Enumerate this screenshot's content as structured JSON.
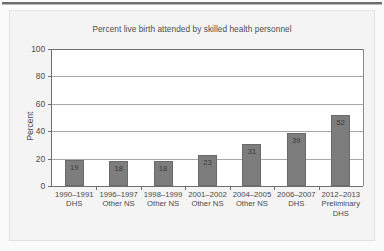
{
  "figure": {
    "background_color": "#fbfbfb",
    "panel_color": "#f4f4f4",
    "top_rule_color": "#6e6e6e"
  },
  "chart_data": {
    "type": "bar",
    "title": "Percent live birth attended by skilled health personnel",
    "xlabel": "",
    "ylabel": "Percent",
    "ylim": [
      0,
      100
    ],
    "yticks": [
      0,
      20,
      40,
      60,
      80,
      100
    ],
    "grid": true,
    "legend": "none",
    "bar_color": "#7d7d7d",
    "categories": [
      "1990–1991 DHS",
      "1996–1997 Other NS",
      "1998–1999 Other NS",
      "2001–2002 Other NS",
      "2004–2005 Other NS",
      "2006–2007 DHS",
      "2012–2013 Preliminary DHS"
    ],
    "category_lines": [
      [
        "1990–1991",
        "DHS"
      ],
      [
        "1996–1997",
        "Other NS"
      ],
      [
        "1998–1999",
        "Other NS"
      ],
      [
        "2001–2002",
        "Other NS"
      ],
      [
        "2004–2005",
        "Other NS"
      ],
      [
        "2006–2007",
        "DHS"
      ],
      [
        "2012–2013",
        "Preliminary",
        "DHS"
      ]
    ],
    "values": [
      19,
      18,
      18,
      23,
      31,
      39,
      52
    ],
    "value_labels": [
      "19",
      "18",
      "18",
      "23",
      "31",
      "39",
      "52"
    ],
    "ytick_labels": [
      "0",
      "20",
      "40",
      "60",
      "80",
      "100"
    ]
  }
}
